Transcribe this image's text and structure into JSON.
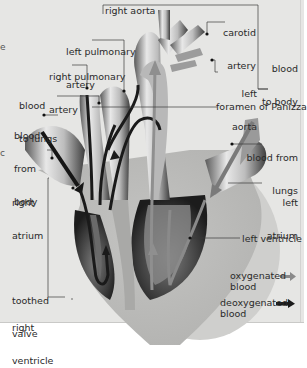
{
  "diagram": {
    "style": "grayscale illustration",
    "background_color": "#e6e6e4",
    "labels": {
      "right_aorta": "right aorta",
      "carotid_artery_1": "carotid",
      "carotid_artery_2": "artery",
      "blood_to_body_1": "blood",
      "blood_to_body_2": "to body",
      "left_aorta_1": "left",
      "left_aorta_2": "aorta",
      "left_pulmonary_artery_1": "left pulmonary",
      "left_pulmonary_artery_2": "artery",
      "right_pulmonary_artery_1": "right pulmonary",
      "right_pulmonary_artery_2": "artery",
      "blood_to_lungs_1": "blood",
      "blood_to_lungs_2": "to lungs",
      "foramen_of_panizza": "foramen of Panizza",
      "blood_from_body_1": "blood",
      "blood_from_body_2": "from",
      "blood_from_body_3": "body",
      "blood_from_lungs_1": "blood from",
      "blood_from_lungs_2": "lungs",
      "right_atrium_1": "right",
      "right_atrium_2": "atrium",
      "left_atrium_1": "left",
      "left_atrium_2": "atrium",
      "left_ventricle": "left ventricle",
      "toothed_valve_1": "toothed",
      "toothed_valve_2": "valve",
      "right_ventricle_1": "right",
      "right_ventricle_2": "ventricle"
    },
    "legend": {
      "oxygenated_1": "oxygenated",
      "oxygenated_2": "blood",
      "oxygenated_arrow_color": "#8a8a8a",
      "deoxygenated_1": "deoxygenated",
      "deoxygenated_2": "blood",
      "deoxygenated_arrow_color": "#1a1a1a"
    },
    "edge_glyphs": [
      "e",
      "c",
      "c"
    ]
  }
}
